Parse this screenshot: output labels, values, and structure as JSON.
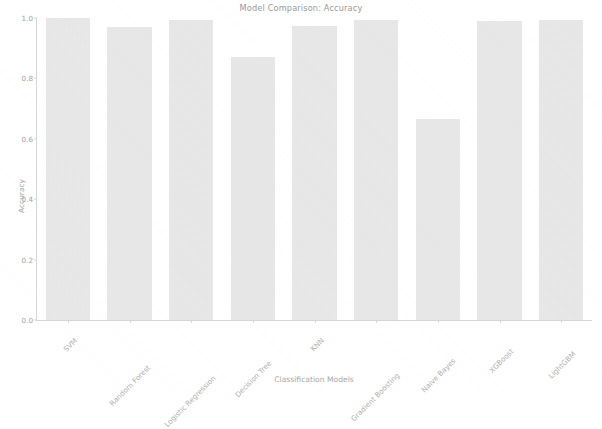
{
  "chart_data": {
    "type": "bar",
    "title": "Model Comparison: Accuracy",
    "xlabel": "Classification Models",
    "ylabel": "Accuracy",
    "categories": [
      "SVM",
      "Random Forest",
      "Logistic Regression",
      "Decision Tree",
      "KNN",
      "Gradient Boosting",
      "Naive Bayes",
      "XGBoost",
      "LightGBM"
    ],
    "values": [
      1.0,
      0.97,
      0.995,
      0.87,
      0.975,
      0.995,
      0.665,
      0.99,
      0.995
    ],
    "ylim": [
      0.0,
      1.0
    ],
    "yticks": [
      0.0,
      0.2,
      0.4,
      0.6,
      0.8,
      1.0
    ],
    "ytick_labels": [
      "0.0",
      "0.2",
      "0.4",
      "0.6",
      "0.8",
      "1.0"
    ],
    "grid": false,
    "legend": null,
    "bar_color": "#e3e3e3",
    "axis_color": "#d6d6d6",
    "text_color": "#a3a3a3",
    "xtick_rotation": -45
  },
  "figure": {
    "background": "#ffffff"
  }
}
